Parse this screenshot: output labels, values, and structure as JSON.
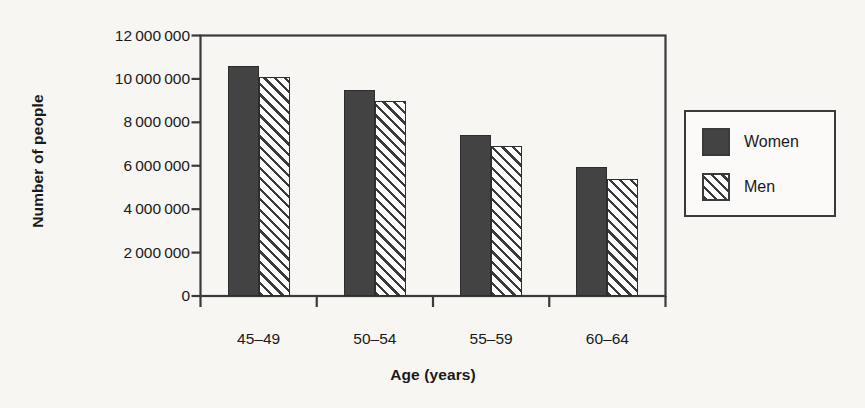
{
  "chart_data": {
    "type": "bar",
    "title": "",
    "xlabel": "Age (years)",
    "ylabel": "Number of people",
    "categories": [
      "45–49",
      "50–54",
      "55–59",
      "60–64"
    ],
    "series": [
      {
        "name": "Women",
        "values": [
          10600000,
          9500000,
          7400000,
          5950000
        ],
        "style": "solid",
        "color": "#434343"
      },
      {
        "name": "Men",
        "values": [
          10100000,
          9000000,
          6900000,
          5400000
        ],
        "style": "diagonal-hatch",
        "color": "#3a3a3a"
      }
    ],
    "ylim": [
      0,
      12000000
    ],
    "yticks": [
      0,
      2000000,
      4000000,
      6000000,
      8000000,
      10000000,
      12000000
    ],
    "ytick_labels": [
      "0",
      "2 000 000",
      "4 000 000",
      "6 000 000",
      "8 000 000",
      "10 000 000",
      "12 000 000"
    ],
    "grid": false,
    "legend_position": "right-outside",
    "frame": "box",
    "background_color": "#f7f6f3"
  },
  "legend": {
    "items": [
      {
        "label": "Women"
      },
      {
        "label": "Men"
      }
    ]
  },
  "axes": {
    "y_title": "Number of people",
    "x_title": "Age (years)"
  }
}
